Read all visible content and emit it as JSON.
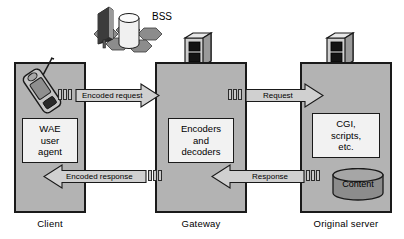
{
  "diagram": {
    "colors": {
      "node_fill": "#b3b3b3",
      "inner_fill": "#f2f2f2",
      "arrow_fill": "#d0d0d0",
      "outline": "#1a1a1a",
      "cylinder_fill": "#8c8c8c",
      "tower_dark": "#2e2e2e",
      "base_cell": "#8c8c8c"
    },
    "nodes": [
      {
        "id": "client",
        "label": "Client",
        "inner_lines": [
          "WAE",
          "user",
          "agent"
        ],
        "icon": "mobile-phone-icon"
      },
      {
        "id": "gateway",
        "label": "Gateway",
        "inner_lines": [
          "Encoders",
          "and",
          "decoders"
        ],
        "icon": "server-rack-icon"
      },
      {
        "id": "origin-server",
        "label": "Original server",
        "inner_lines": [
          "CGI,",
          "scripts,",
          "etc."
        ],
        "icon": "server-rack-icon",
        "store_label": "Content",
        "store_icon": "database-cylinder-icon"
      }
    ],
    "bss": {
      "label": "BSS",
      "icon": "base-station-icon"
    },
    "arrows": [
      {
        "id": "encoded-request",
        "label": "Encoded request",
        "direction": "right",
        "from": "client",
        "to": "gateway"
      },
      {
        "id": "request",
        "label": "Request",
        "direction": "right",
        "from": "gateway",
        "to": "origin-server"
      },
      {
        "id": "encoded-response",
        "label": "Encoded response",
        "direction": "left",
        "from": "gateway",
        "to": "client"
      },
      {
        "id": "response",
        "label": "Response",
        "direction": "left",
        "from": "origin-server",
        "to": "gateway"
      }
    ]
  }
}
